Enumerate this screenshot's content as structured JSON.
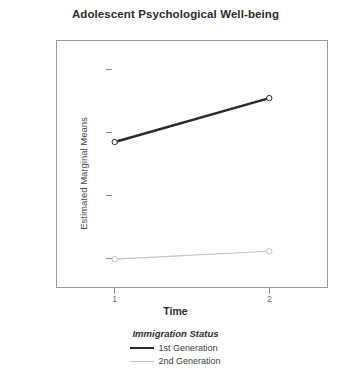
{
  "chart_data": {
    "type": "line",
    "title": "Adolescent Psychological Well-being",
    "xlabel": "Time",
    "ylabel": "Estimated Marginal Means",
    "x": [
      1,
      2
    ],
    "categories": [
      "1",
      "2"
    ],
    "xticklabels": [
      "1",
      "2"
    ],
    "yticklabels": [
      "1.92",
      "1.90",
      "1.88",
      "1.86"
    ],
    "yticks": [
      1.92,
      1.9,
      1.88,
      1.86
    ],
    "ylim": [
      1.8505,
      1.9295
    ],
    "xlim": [
      0.62,
      2.38
    ],
    "grid": false,
    "legend_position": "bottom",
    "legend_title": "Immigration Status",
    "marker": "circle",
    "series": [
      {
        "name": "1st Generation",
        "values": [
          1.897,
          1.911
        ],
        "color": "#2a2a2a",
        "linewidth": 2.4
      },
      {
        "name": "2nd Generation",
        "values": [
          1.8597,
          1.8622
        ],
        "color": "#c2c2c2",
        "linewidth": 1.2
      }
    ]
  },
  "colors": {
    "series_1st_generation": "#2a2a2a",
    "series_2nd_generation": "#c2c2c2",
    "axis": "#9a9a9a",
    "text": "#3d3d3d",
    "background": "#ffffff"
  }
}
